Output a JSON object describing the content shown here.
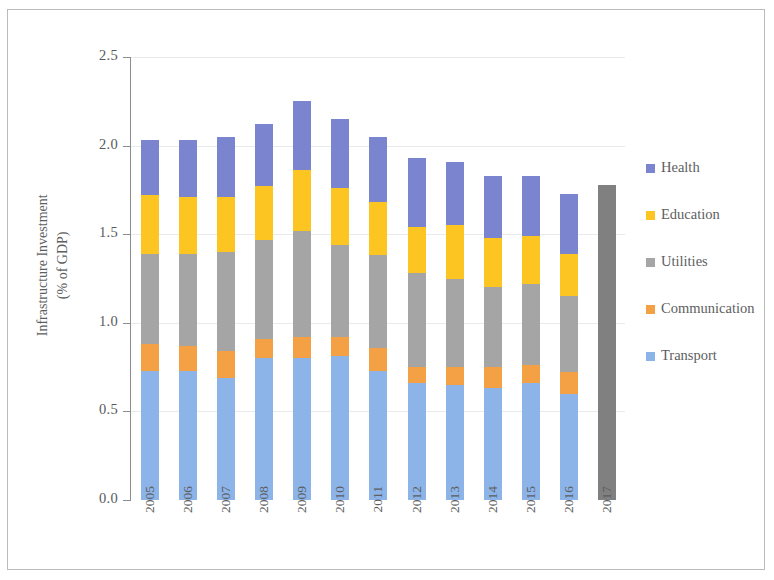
{
  "chart_data": {
    "type": "bar",
    "stacked": true,
    "title": "",
    "xlabel": "",
    "ylabel": "Infrastructure Investment\n(% of GDP)",
    "ylabel_line1": "Infrastructure Investment",
    "ylabel_line2": "(% of GDP)",
    "ylim": [
      0.0,
      2.5
    ],
    "ytick_labels": [
      "2.5",
      "2.0",
      "1.5",
      "1.0",
      "0.5",
      "0.0"
    ],
    "ytick_values": [
      2.5,
      2.0,
      1.5,
      1.0,
      0.5,
      0.0
    ],
    "grid": true,
    "legend_position": "right",
    "categories": [
      "2005",
      "2006",
      "2007",
      "2008",
      "2009",
      "2010",
      "2011",
      "2012",
      "2013",
      "2014",
      "2015",
      "2016",
      "2017"
    ],
    "series": [
      {
        "name": "Transport",
        "color": "#8cb4e8",
        "values": [
          0.73,
          0.73,
          0.69,
          0.8,
          0.8,
          0.81,
          0.73,
          0.66,
          0.65,
          0.63,
          0.66,
          0.6,
          null
        ]
      },
      {
        "name": "Communication",
        "color": "#f4a045",
        "values": [
          0.15,
          0.14,
          0.15,
          0.11,
          0.12,
          0.11,
          0.13,
          0.09,
          0.1,
          0.12,
          0.1,
          0.12,
          null
        ]
      },
      {
        "name": "Utilities",
        "color": "#a5a5a5",
        "values": [
          0.51,
          0.52,
          0.56,
          0.56,
          0.6,
          0.52,
          0.52,
          0.53,
          0.5,
          0.45,
          0.46,
          0.43,
          null
        ]
      },
      {
        "name": "Education",
        "color": "#fcc521",
        "values": [
          0.33,
          0.32,
          0.31,
          0.3,
          0.34,
          0.32,
          0.3,
          0.26,
          0.3,
          0.28,
          0.27,
          0.24,
          null
        ]
      },
      {
        "name": "Health",
        "color": "#7b85cf",
        "values": [
          0.31,
          0.32,
          0.34,
          0.35,
          0.39,
          0.39,
          0.37,
          0.39,
          0.36,
          0.35,
          0.34,
          0.34,
          null
        ]
      },
      {
        "name": "Total (2017)",
        "color": "#808080",
        "legend_shown": false,
        "values": [
          null,
          null,
          null,
          null,
          null,
          null,
          null,
          null,
          null,
          null,
          null,
          null,
          1.78
        ]
      }
    ],
    "totals": [
      2.03,
      2.03,
      2.05,
      2.12,
      2.25,
      2.15,
      2.05,
      1.93,
      1.91,
      1.83,
      1.83,
      1.73,
      1.78
    ],
    "annotations": []
  },
  "legend": {
    "items": [
      {
        "label": "Health",
        "color": "#7b85cf"
      },
      {
        "label": "Education",
        "color": "#fcc521"
      },
      {
        "label": "Utilities",
        "color": "#a5a5a5"
      },
      {
        "label": "Communication",
        "color": "#f4a045"
      },
      {
        "label": "Transport",
        "color": "#8cb4e8"
      }
    ]
  }
}
